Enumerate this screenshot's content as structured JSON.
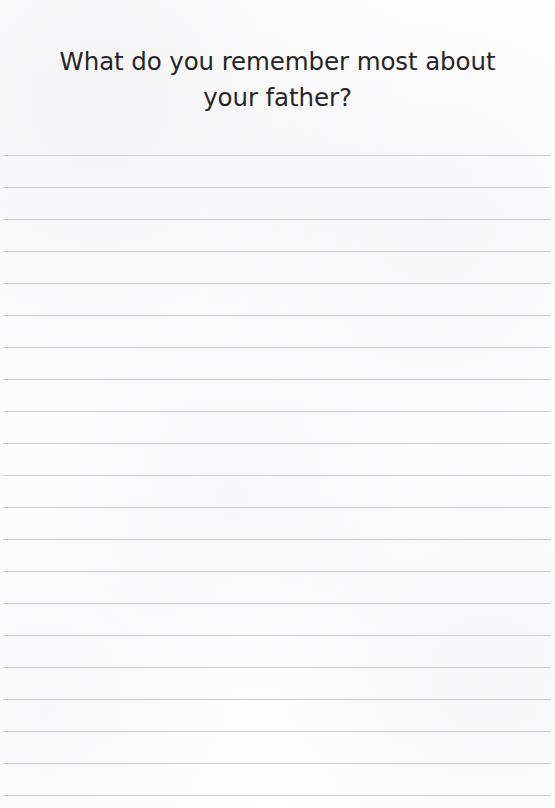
{
  "page": {
    "kind": "lined-journal-page",
    "width": 555,
    "height": 808,
    "background_color": "#fdfdfd"
  },
  "prompt": {
    "text": "What do you remember most about your father?",
    "line_1": "What do you remember most about your",
    "line_2": "father?",
    "alignment": "center",
    "text_color": "#262628",
    "font_size_px": 24.5
  },
  "writing_area": {
    "label": "ruled writing lines",
    "line_count": 21,
    "first_line_y": 155,
    "line_spacing_px": 32,
    "line_color": "#c6c6cb",
    "line_thickness_px": 1,
    "line_left_x": 3,
    "line_width_px": 548,
    "line_y_positions": [
      155,
      187,
      219,
      251,
      283,
      315,
      347,
      379,
      411,
      443,
      475,
      507,
      539,
      571,
      603,
      635,
      667,
      699,
      731,
      763,
      795
    ]
  }
}
